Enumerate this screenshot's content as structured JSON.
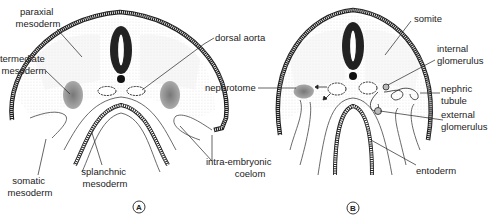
{
  "figure": {
    "panels": [
      {
        "id": "A",
        "label": "A",
        "annotations": {
          "paraxial_mesoderm": [
            "paraxial",
            "mesoderm"
          ],
          "intermediate_mesoderm": [
            "intermediate",
            "mesoderm"
          ],
          "somatic_mesoderm": [
            "somatic",
            "mesoderm"
          ],
          "splanchnic_mesoderm": [
            "splanchnic",
            "mesoderm"
          ],
          "intra_embryonic_coelom": [
            "intra-embryonic",
            "coelom"
          ],
          "dorsal_aorta": "dorsal aorta"
        }
      },
      {
        "id": "B",
        "label": "B",
        "annotations": {
          "nephrotome": "nephrotome",
          "somite": "somite",
          "internal_glomerulus": [
            "internal",
            "glomerulus"
          ],
          "nephric_tubule": [
            "nephric",
            "tubule"
          ],
          "external_glomerulus": [
            "external",
            "glomerulus"
          ],
          "entoderm": "entoderm"
        }
      }
    ]
  }
}
